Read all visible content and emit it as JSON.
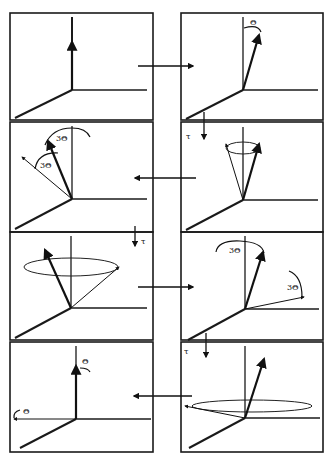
{
  "diagram": {
    "panels": [
      {
        "id": 1,
        "position": "row1-left",
        "labels": []
      },
      {
        "id": 2,
        "position": "row1-right",
        "labels": [
          "Θ"
        ]
      },
      {
        "id": 3,
        "position": "row2-right",
        "labels": [
          "τ"
        ]
      },
      {
        "id": 4,
        "position": "row2-left",
        "labels": [
          "3Θ",
          "3Θ"
        ]
      },
      {
        "id": 5,
        "position": "row3-left",
        "labels": [
          "τ"
        ]
      },
      {
        "id": 6,
        "position": "row3-right",
        "labels": [
          "3Θ",
          "3Θ"
        ]
      },
      {
        "id": 7,
        "position": "row4-right",
        "labels": [
          "τ"
        ]
      },
      {
        "id": 8,
        "position": "row4-left",
        "labels": [
          "Θ",
          "Θ"
        ]
      }
    ],
    "labels": {
      "theta": "Θ",
      "three_theta": "3Θ",
      "tau": "τ"
    },
    "flow": [
      "1→2",
      "2→3",
      "3→4",
      "4→5",
      "5→6",
      "6→7",
      "7→8"
    ],
    "colors": {
      "line": "#111111",
      "background": "#ffffff"
    }
  }
}
